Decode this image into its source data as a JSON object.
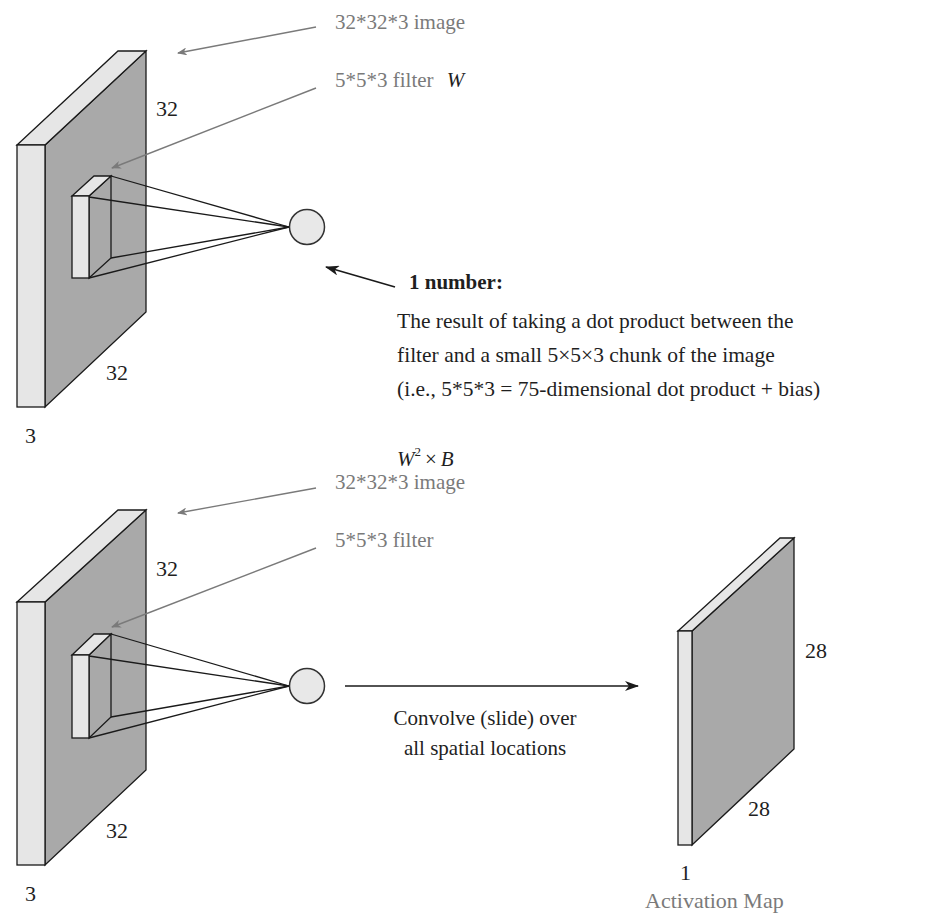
{
  "header": {
    "cropped_text": "LECTURE · CONVOLUTION LAYER"
  },
  "top_diagram": {
    "image_label": "32*32*3 image",
    "filter_label": "5*5*3 filter",
    "filter_symbol": "W",
    "height_label": "32",
    "width_label": "32",
    "depth_label": "3",
    "result_title": "1 number:",
    "result_lines": [
      "The result of taking a dot product between the",
      "filter and a small 5×5×3 chunk of the image",
      "(i.e., 5*5*3 = 75-dimensional dot product + bias)"
    ],
    "formula": {
      "base": "W",
      "exponent": "2",
      "operator": "×",
      "rhs": "B"
    }
  },
  "bottom_diagram": {
    "image_label": "32*32*3 image",
    "filter_label": "5*5*3 filter",
    "height_label": "32",
    "width_label": "32",
    "depth_label": "3",
    "convolve_lines": [
      "Convolve (slide) over",
      "all spatial locations"
    ],
    "activation_map": {
      "height_label": "28",
      "width_label": "28",
      "depth_label": "1",
      "title": "Activation Map"
    }
  },
  "colors": {
    "volume_face": "#a9a9a9",
    "volume_side": "#e6e6e6",
    "outline": "#1a1a1a",
    "pointer_arrow": "#7a7a7a",
    "neuron_fill": "#e8e8e8",
    "label_gray": "#7a7a7a"
  }
}
